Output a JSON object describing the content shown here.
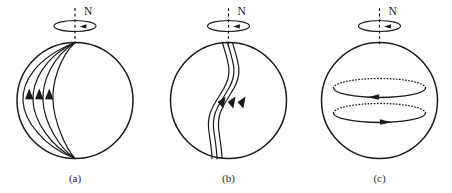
{
  "figure": {
    "background_color": "#ffffff",
    "line_color": "#1a1a1a",
    "width": 452,
    "height": 193
  },
  "panels": [
    {
      "id": "a",
      "label": "(a)",
      "pole_label": "N",
      "description": "Poloidal field lines running pole to pole on a rotating sphere",
      "sphere": {
        "cx": 75,
        "cy": 100.5,
        "r": 58
      },
      "rotation": {
        "cx": 75,
        "cy": 26,
        "rx": 21,
        "ry": 5.5,
        "arrow_direction": "right"
      },
      "axis": {
        "x": 75,
        "y_top": 8,
        "y_bottom": 44
      },
      "field_line_count": 3,
      "arrow_direction": "up",
      "arrow_count": 3
    },
    {
      "id": "b",
      "label": "(b)",
      "pole_label": "N",
      "description": "Field lines sheared into S shapes by differential rotation",
      "sphere": {
        "cx": 228.5,
        "cy": 100.5,
        "r": 58
      },
      "rotation": {
        "cx": 228.5,
        "cy": 26,
        "rx": 21,
        "ry": 5.5,
        "arrow_direction": "right"
      },
      "axis": {
        "x": 228.5,
        "y_top": 8,
        "y_bottom": 44
      },
      "field_line_count": 3,
      "arrow_direction": "up-right",
      "arrow_count": 3
    },
    {
      "id": "c",
      "label": "(c)",
      "pole_label": "N",
      "description": "Toroidal field loops wound around the rotation axis",
      "sphere": {
        "cx": 379.5,
        "cy": 100.5,
        "r": 58
      },
      "rotation": {
        "cx": 379.5,
        "cy": 26,
        "rx": 21,
        "ry": 5.5,
        "arrow_direction": "right"
      },
      "axis": {
        "x": 379.5,
        "y_top": 8,
        "y_bottom": 44
      },
      "loops": [
        {
          "name": "upper-toroidal-loop",
          "cx": 379.5,
          "cy": 88,
          "rx": 46,
          "ry": 9.5,
          "arrow_direction": "left"
        },
        {
          "name": "lower-toroidal-loop",
          "cx": 379.5,
          "cy": 113,
          "rx": 46,
          "ry": 9.5,
          "arrow_direction": "right"
        }
      ]
    }
  ]
}
